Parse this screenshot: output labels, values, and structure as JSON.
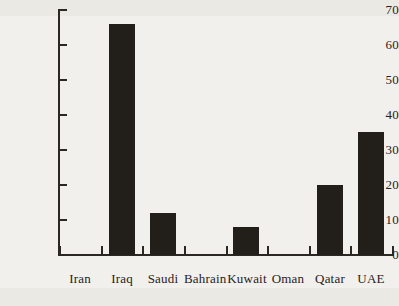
{
  "chart_data": {
    "type": "bar",
    "title": "",
    "subtitle": "",
    "xlabel": "",
    "ylabel": "",
    "categories": [
      "Iran",
      "Iraq",
      "Saudi",
      "Bahrain",
      "Kuwait",
      "Oman",
      "Qatar",
      "UAE"
    ],
    "values": [
      0,
      66,
      12,
      0,
      8,
      0,
      20,
      35
    ],
    "series": [
      {
        "name": "",
        "values": [
          0,
          66,
          12,
          0,
          8,
          0,
          20,
          35
        ]
      }
    ],
    "ylim": [
      0,
      70
    ],
    "ytick_values": [
      0,
      10,
      20,
      30,
      40,
      50,
      60,
      70
    ],
    "ytick_labels": [
      "0",
      "10",
      "20",
      "30",
      "40",
      "50",
      "60",
      "70"
    ],
    "grid": false,
    "legend": false,
    "legend_position": "none",
    "bar_color": "#221e19",
    "axis_color": "#2b2722",
    "background_color": "#f2f0ec"
  }
}
